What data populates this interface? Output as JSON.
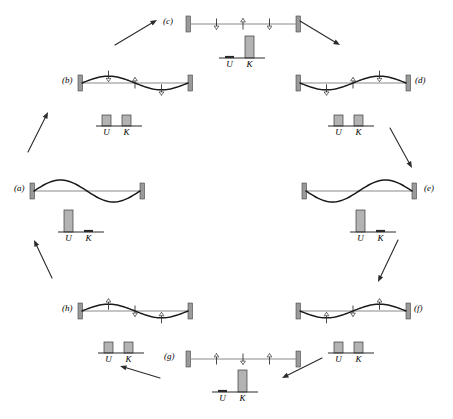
{
  "figure": {
    "type": "physics-diagram",
    "cycle_direction": "clockwise",
    "energy_labels": {
      "potential": "U",
      "kinetic": "K"
    }
  },
  "panels": [
    {
      "id": "a",
      "label": "(a)",
      "shape": "max-displacement",
      "phase": 0,
      "amplitude": 1.0,
      "wave_sign": 1,
      "arrows": [],
      "energy": {
        "U": 1.0,
        "K": 0.0
      },
      "u_label": "U",
      "k_label": "K"
    },
    {
      "id": "b",
      "label": "(b)",
      "shape": "mid-displacement",
      "phase": 45,
      "amplitude": 0.62,
      "wave_sign": 1,
      "arrows": [
        {
          "x": 0.25,
          "dir": "down"
        },
        {
          "x": 0.5,
          "dir": "up"
        },
        {
          "x": 0.75,
          "dir": "down"
        }
      ],
      "energy": {
        "U": 0.5,
        "K": 0.5
      },
      "u_label": "U",
      "k_label": "K"
    },
    {
      "id": "c",
      "label": "(c)",
      "shape": "flat",
      "phase": 90,
      "amplitude": 0.0,
      "wave_sign": 0,
      "arrows": [
        {
          "x": 0.25,
          "dir": "down"
        },
        {
          "x": 0.5,
          "dir": "up"
        },
        {
          "x": 0.75,
          "dir": "down"
        }
      ],
      "energy": {
        "U": 0.0,
        "K": 1.0
      },
      "u_label": "U",
      "k_label": "K"
    },
    {
      "id": "d",
      "label": "(d)",
      "shape": "mid-displacement",
      "phase": 135,
      "amplitude": 0.62,
      "wave_sign": -1,
      "arrows": [
        {
          "x": 0.25,
          "dir": "down"
        },
        {
          "x": 0.5,
          "dir": "up"
        },
        {
          "x": 0.75,
          "dir": "down"
        }
      ],
      "energy": {
        "U": 0.5,
        "K": 0.5
      },
      "u_label": "U",
      "k_label": "K"
    },
    {
      "id": "e",
      "label": "(e)",
      "shape": "max-displacement",
      "phase": 180,
      "amplitude": 1.0,
      "wave_sign": -1,
      "arrows": [],
      "energy": {
        "U": 1.0,
        "K": 0.0
      },
      "u_label": "U",
      "k_label": "K"
    },
    {
      "id": "f",
      "label": "(f)",
      "shape": "mid-displacement",
      "phase": 225,
      "amplitude": 0.62,
      "wave_sign": -1,
      "arrows": [
        {
          "x": 0.25,
          "dir": "up"
        },
        {
          "x": 0.5,
          "dir": "down"
        },
        {
          "x": 0.75,
          "dir": "up"
        }
      ],
      "energy": {
        "U": 0.5,
        "K": 0.5
      },
      "u_label": "U",
      "k_label": "K"
    },
    {
      "id": "g",
      "label": "(g)",
      "shape": "flat",
      "phase": 270,
      "amplitude": 0.0,
      "wave_sign": 0,
      "arrows": [
        {
          "x": 0.25,
          "dir": "up"
        },
        {
          "x": 0.5,
          "dir": "down"
        },
        {
          "x": 0.75,
          "dir": "up"
        }
      ],
      "energy": {
        "U": 0.0,
        "K": 1.0
      },
      "u_label": "U",
      "k_label": "K"
    },
    {
      "id": "h",
      "label": "(h)",
      "shape": "mid-displacement",
      "phase": 315,
      "amplitude": 0.62,
      "wave_sign": 1,
      "arrows": [
        {
          "x": 0.25,
          "dir": "up"
        },
        {
          "x": 0.5,
          "dir": "down"
        },
        {
          "x": 0.75,
          "dir": "up"
        }
      ],
      "energy": {
        "U": 0.5,
        "K": 0.5
      },
      "u_label": "U",
      "k_label": "K"
    }
  ],
  "layout": {
    "panel_positions": {
      "a": {
        "x": 14,
        "y": 176,
        "label_x": 14,
        "label_y": 184,
        "string_x": 30,
        "string_y": 176,
        "energy_x": 52,
        "energy_y": 206
      },
      "b": {
        "x": 62,
        "y": 68,
        "label_x": 62,
        "label_y": 76,
        "string_x": 78,
        "string_y": 68,
        "energy_x": 90,
        "energy_y": 100
      },
      "c": {
        "x": 163,
        "y": 9,
        "label_x": 163,
        "label_y": 17,
        "string_x": 186,
        "string_y": 9,
        "energy_x": 213,
        "energy_y": 32
      },
      "d": {
        "x": 296,
        "y": 68,
        "label_x": 415,
        "label_y": 76,
        "string_x": 296,
        "string_y": 68,
        "energy_x": 322,
        "energy_y": 100
      },
      "e": {
        "x": 302,
        "y": 176,
        "label_x": 424,
        "label_y": 184,
        "string_x": 302,
        "string_y": 176,
        "energy_x": 344,
        "energy_y": 206
      },
      "f": {
        "x": 296,
        "y": 296,
        "label_x": 414,
        "label_y": 304,
        "string_x": 296,
        "string_y": 296,
        "energy_x": 322,
        "energy_y": 327
      },
      "g": {
        "x": 164,
        "y": 344,
        "label_x": 164,
        "label_y": 352,
        "string_x": 186,
        "string_y": 344,
        "energy_x": 206,
        "energy_y": 366
      },
      "h": {
        "x": 62,
        "y": 296,
        "label_x": 62,
        "label_y": 304,
        "string_x": 78,
        "string_y": 296,
        "energy_x": 92,
        "energy_y": 327
      }
    },
    "cycle_arrows": [
      {
        "from": "b",
        "to": "c",
        "x1": 115,
        "y1": 45,
        "x2": 157,
        "y2": 20
      },
      {
        "from": "c",
        "to": "d",
        "x1": 300,
        "y1": 21,
        "x2": 340,
        "y2": 45
      },
      {
        "from": "d",
        "to": "e",
        "x1": 390,
        "y1": 128,
        "x2": 412,
        "y2": 168
      },
      {
        "from": "e",
        "to": "f",
        "x1": 398,
        "y1": 240,
        "x2": 378,
        "y2": 282
      },
      {
        "from": "f",
        "to": "g",
        "x1": 322,
        "y1": 358,
        "x2": 282,
        "y2": 378
      },
      {
        "from": "g",
        "to": "h",
        "x1": 160,
        "y1": 378,
        "x2": 120,
        "y2": 366
      },
      {
        "from": "h",
        "to": "a",
        "x1": 52,
        "y1": 278,
        "x2": 34,
        "y2": 240
      },
      {
        "from": "a",
        "to": "b",
        "x1": 28,
        "y1": 152,
        "x2": 48,
        "y2": 112
      }
    ]
  }
}
